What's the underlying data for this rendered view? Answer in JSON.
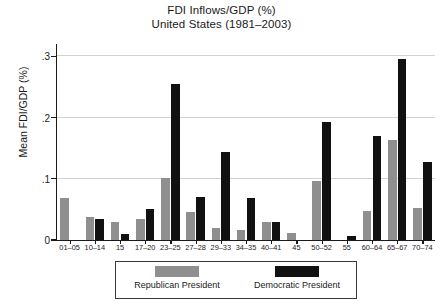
{
  "chart_data": {
    "type": "bar",
    "title": "FDI Inflows/GDP (%)",
    "subtitle": "United States (1981–2003)",
    "xlabel": "",
    "ylabel": "Mean FDI/GDP (%)",
    "ylim": [
      0,
      0.32
    ],
    "yticks": [
      0,
      0.1,
      0.2,
      0.3
    ],
    "ytick_labels": [
      "0",
      ".1",
      ".2",
      ".3"
    ],
    "grid": true,
    "legend_position": "bottom-center",
    "categories": [
      "01–05",
      "10–14",
      "15",
      "17–20",
      "23–25",
      "27–28",
      "29–33",
      "34–35",
      "40–41",
      "45",
      "50–52",
      "55",
      "60–64",
      "65–67",
      "70–74"
    ],
    "series": [
      {
        "name": "Republican President",
        "color": "#8f8f8f",
        "values": [
          0.068,
          0.038,
          0.03,
          0.035,
          0.102,
          0.045,
          0.019,
          0.017,
          0.03,
          0.011,
          0.097,
          0.0,
          0.047,
          0.163,
          0.053
        ]
      },
      {
        "name": "Democratic President",
        "color": "#111111",
        "values": [
          0.0,
          0.035,
          0.01,
          0.05,
          0.254,
          0.07,
          0.143,
          0.068,
          0.029,
          0.0,
          0.192,
          0.007,
          0.17,
          0.296,
          0.127
        ]
      }
    ]
  },
  "legend": {
    "entries": [
      {
        "label": "Republican President",
        "color": "#8f8f8f"
      },
      {
        "label": "Democratic President",
        "color": "#111111"
      }
    ]
  }
}
